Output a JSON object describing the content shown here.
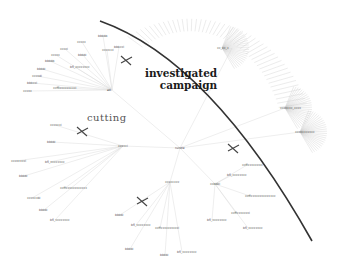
{
  "annotations": {
    "investigated_line1": "investigated",
    "investigated_line2": "campaign",
    "cutting": "cutting"
  },
  "root": {
    "label": "rundle",
    "x": 180,
    "y": 148
  },
  "branches": [
    {
      "hub": {
        "label": "ad",
        "x": 112,
        "y": 90
      },
      "leaves": [
        {
          "label": "xxxxx",
          "x": 28,
          "y": 91
        },
        {
          "label": "bbbxxl",
          "x": 32,
          "y": 83
        },
        {
          "label": "xxxxdl",
          "x": 37,
          "y": 76
        },
        {
          "label": "bbbbl",
          "x": 42,
          "y": 69
        },
        {
          "label": "bbbbb",
          "x": 50,
          "y": 61
        },
        {
          "label": "xxxxx",
          "x": 56,
          "y": 55
        },
        {
          "label": "xxxxl",
          "x": 65,
          "y": 49
        },
        {
          "label": "xxxxx",
          "x": 82,
          "y": 42
        },
        {
          "label": "bbbbb",
          "x": 103,
          "y": 36
        },
        {
          "label": "bbbbl",
          "x": 83,
          "y": 55
        },
        {
          "label": "xxxxxxl",
          "x": 107,
          "y": 50
        },
        {
          "label": "bbbxxl",
          "x": 119,
          "y": 47
        },
        {
          "label": "bfl_xxxxxxxx",
          "x": 75,
          "y": 67
        },
        {
          "label": "xxfflxxxxxxxxxl",
          "x": 58,
          "y": 88
        }
      ],
      "cut": {
        "x": 126,
        "y": 60
      }
    },
    {
      "hub": {
        "label": "xxxxxl",
        "x": 123,
        "y": 146
      },
      "leaves": [
        {
          "label": "xxxxxxl",
          "x": 55,
          "y": 125
        },
        {
          "label": "bbbbl",
          "x": 52,
          "y": 142
        },
        {
          "label": "xxxxxxxxl",
          "x": 16,
          "y": 161
        },
        {
          "label": "bfl_xxxxxxxx",
          "x": 50,
          "y": 162
        },
        {
          "label": "bbbbl",
          "x": 24,
          "y": 176
        },
        {
          "label": "xxffxxxxxxxxxxxx",
          "x": 65,
          "y": 188
        },
        {
          "label": "xxxxxxbl",
          "x": 32,
          "y": 198
        },
        {
          "label": "bbbbl",
          "x": 44,
          "y": 210
        },
        {
          "label": "bfl_xxxxxxxx",
          "x": 55,
          "y": 220
        }
      ],
      "cut": {
        "x": 82,
        "y": 131
      }
    },
    {
      "hub": {
        "label": "xxxxxxxx",
        "x": 170,
        "y": 182
      },
      "leaves": [
        {
          "label": "bbbbl",
          "x": 120,
          "y": 215
        },
        {
          "label": "bfl_xxxxxxxx",
          "x": 136,
          "y": 225
        },
        {
          "label": "xxffxxxxxxxxxxl",
          "x": 160,
          "y": 228
        },
        {
          "label": "bbbbl",
          "x": 130,
          "y": 249
        },
        {
          "label": "bbbbl",
          "x": 165,
          "y": 255
        },
        {
          "label": "bfl_xxxxxxxx",
          "x": 182,
          "y": 252
        }
      ],
      "cut": {
        "x": 142,
        "y": 201
      }
    },
    {
      "hub": {
        "label": "xxbbbl",
        "x": 215,
        "y": 184
      },
      "leaves": [
        {
          "label": "xxffxxxxxxxxl",
          "x": 247,
          "y": 165
        },
        {
          "label": "bfl_xxxxxxxx",
          "x": 232,
          "y": 175
        },
        {
          "label": "xxffxxxxxxxxxxxxxx",
          "x": 250,
          "y": 196
        },
        {
          "label": "xxffxxxxxxxl",
          "x": 236,
          "y": 213
        },
        {
          "label": "bfl_xxxxxxxx",
          "x": 212,
          "y": 220
        },
        {
          "label": "bfl_xxxxxxxx",
          "x": 248,
          "y": 228
        }
      ],
      "cut": {
        "x": 233,
        "y": 148
      }
    }
  ],
  "dense_clusters": [
    {
      "label": "xx_xx_x",
      "x": 222,
      "y": 48
    },
    {
      "label": "xxxxxxx_xxxx",
      "x": 285,
      "y": 108
    },
    {
      "label": "xxxxxxxxxxx",
      "x": 300,
      "y": 132
    }
  ],
  "colors": {
    "edge": "#d9d9d9",
    "divider": "#333333",
    "cut_mark": "#444444",
    "label": "#444444"
  }
}
